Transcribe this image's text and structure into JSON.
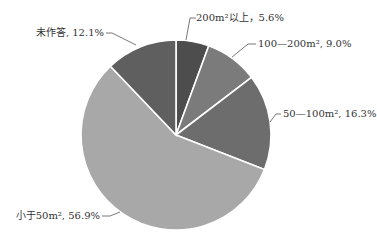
{
  "chart_data": {
    "type": "pie",
    "title": "",
    "start_angle_deg": 0,
    "direction": "clockwise",
    "slices": [
      {
        "label": "200m²以上",
        "value": 5.6,
        "display": "200m²以上，5.6%",
        "color": "#4d4d4d"
      },
      {
        "label": "100—200m²",
        "value": 9.0,
        "display": "100—200m², 9.0%",
        "color": "#7b7b7b"
      },
      {
        "label": "50—100m²",
        "value": 16.3,
        "display": "50—100m², 16.3%",
        "color": "#6d6d6d"
      },
      {
        "label": "小于50m²",
        "value": 56.9,
        "display": "小于50m², 56.9%",
        "color": "#a8a8a8"
      },
      {
        "label": "未作答",
        "value": 12.1,
        "display": "未作答, 12.1%",
        "color": "#5f5f5f"
      }
    ],
    "labels_layout": [
      {
        "x": 196,
        "y": 21,
        "anchor": "start",
        "line": [
          [
            196,
            18
          ],
          [
            190,
            18
          ],
          [
            186,
            40
          ]
        ]
      },
      {
        "x": 258,
        "y": 47,
        "anchor": "start",
        "line": [
          [
            256,
            44
          ],
          [
            248,
            44
          ],
          [
            232,
            57
          ]
        ]
      },
      {
        "x": 283,
        "y": 117,
        "anchor": "start",
        "line": [
          [
            281,
            114
          ],
          [
            276,
            114
          ],
          [
            270,
            122
          ]
        ]
      },
      {
        "x": 100,
        "y": 219,
        "anchor": "end",
        "line": [
          [
            102,
            216
          ],
          [
            110,
            216
          ],
          [
            120,
            212
          ]
        ]
      },
      {
        "x": 104,
        "y": 36,
        "anchor": "end",
        "line": [
          [
            106,
            33
          ],
          [
            112,
            33
          ],
          [
            136,
            45
          ]
        ]
      }
    ],
    "geometry": {
      "cx": 176,
      "cy": 135,
      "r": 95
    }
  }
}
